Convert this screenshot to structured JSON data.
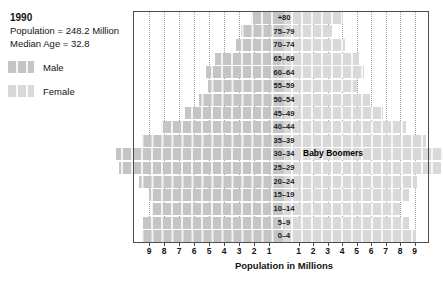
{
  "header": {
    "year": "1990",
    "population": "Population = 248.2 Million",
    "median_age": "Median Age = 32.8"
  },
  "legend": {
    "male": "Male",
    "female": "Female"
  },
  "colors": {
    "male_bar": "#c5c5c5",
    "female_bar": "#d9d9d9",
    "gridline": "#a0a0a0",
    "frame": "#4d4d4d",
    "text": "#141414"
  },
  "axis": {
    "title": "Population in Millions",
    "left_ticks": [
      9,
      8,
      7,
      6,
      5,
      4,
      3,
      2,
      1
    ],
    "right_ticks": [
      1,
      2,
      3,
      4,
      5,
      6,
      7,
      8,
      9
    ]
  },
  "chart_data": {
    "type": "bar",
    "subtype": "population-pyramid",
    "title": "1990",
    "stats": {
      "total_population_millions": 248.2,
      "median_age": 32.8
    },
    "categories_top_to_bottom": [
      "+80",
      "75–79",
      "70–74",
      "65–69",
      "60–64",
      "55–59",
      "50–54",
      "45–49",
      "40–44",
      "35–39",
      "30–34",
      "25–29",
      "20–24",
      "15–19",
      "10–14",
      "5–9",
      "0–4"
    ],
    "series": [
      {
        "name": "Male",
        "side": "left",
        "values": [
          2.2,
          2.9,
          3.2,
          4.6,
          5.2,
          5.1,
          5.7,
          6.6,
          8.2,
          9.5,
          11.2,
          11.0,
          9.7,
          9.0,
          8.8,
          9.4,
          9.5
        ]
      },
      {
        "name": "Female",
        "side": "right",
        "values": [
          4.1,
          3.3,
          4.2,
          5.2,
          5.5,
          5.0,
          5.9,
          6.8,
          8.4,
          9.8,
          11.0,
          10.8,
          9.2,
          8.6,
          8.0,
          8.6,
          9.1
        ]
      }
    ],
    "xlabel": "Population in Millions",
    "x_range_each_side": [
      0,
      10
    ],
    "gridlines": "dotted vertical at each million, both sides",
    "legend_position": "left",
    "annotations": [
      {
        "text": "Baby Boomers",
        "row": "30–34"
      }
    ]
  }
}
